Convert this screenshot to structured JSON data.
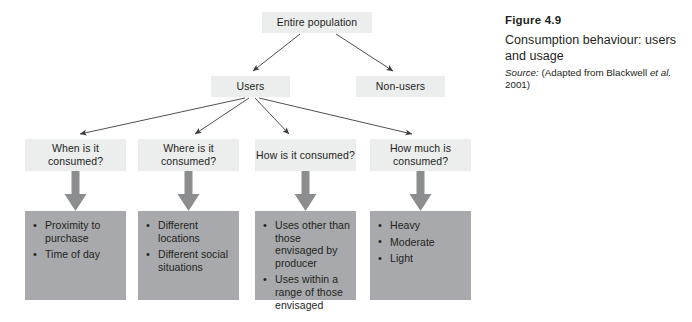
{
  "figure": {
    "number": "Figure 4.9",
    "title": "Consumption behaviour: users and usage",
    "source_label": "Source:",
    "source_open": "(Adapted from Blackwell",
    "source_etal": "et al.",
    "source_close": "2001)"
  },
  "diagram": {
    "root": "Entire population",
    "branches": {
      "users": "Users",
      "non_users": "Non-users"
    },
    "questions": [
      "When is it consumed?",
      "Where is it consumed?",
      "How is it consumed?",
      "How much is consumed?"
    ],
    "details": [
      [
        "Proximity to purchase",
        "Time of day"
      ],
      [
        "Different locations",
        "Different social situations"
      ],
      [
        "Uses other than those envisaged by producer",
        "Uses within a range of those envisaged"
      ],
      [
        "Heavy",
        "Moderate",
        "Light"
      ]
    ]
  },
  "colors": {
    "background": "#ffffff",
    "node_fill": "#eceded",
    "panel_fill": "#a7a9ac",
    "arrow_thin": "#3b3b3b",
    "arrow_thick": "#8b8d8f",
    "text": "#231f20"
  }
}
